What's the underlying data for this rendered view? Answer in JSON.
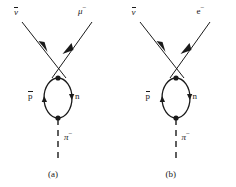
{
  "figure": {
    "background_color": "#ffffff",
    "ink_color": "#1a1a1a",
    "panels": [
      {
        "id": "panel-a",
        "caption": "(a)",
        "incoming_label_base": "ν",
        "incoming_label_overbar": true,
        "incoming_label_sup": "",
        "outgoing_label_base": "μ",
        "outgoing_label_sup": "−",
        "loop_left_label_base": "p",
        "loop_left_label_overbar": true,
        "loop_right_label_base": "n",
        "boson_label_base": "π",
        "boson_label_sup": "−",
        "boson_line_style": "dashed"
      },
      {
        "id": "panel-b",
        "caption": "(b)",
        "incoming_label_base": "ν",
        "incoming_label_overbar": true,
        "incoming_label_sup": "",
        "outgoing_label_base": "e",
        "outgoing_label_sup": "−",
        "loop_left_label_base": "p",
        "loop_left_label_overbar": true,
        "loop_right_label_base": "n",
        "boson_label_base": "π",
        "boson_label_sup": "−",
        "boson_line_style": "dashed"
      }
    ]
  }
}
